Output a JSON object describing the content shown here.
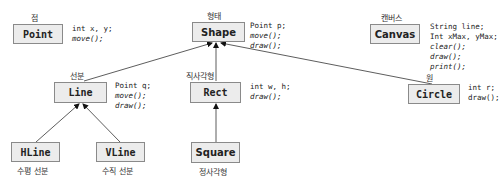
{
  "diagram": {
    "classes": [
      {
        "id": "point",
        "name": "Point",
        "label": "점",
        "fields": [
          "int x, y;"
        ],
        "methods": [
          "move();"
        ]
      },
      {
        "id": "shape",
        "name": "Shape",
        "label": "형태",
        "fields": [
          "Point p;"
        ],
        "methods": [
          "move();",
          "draw();"
        ]
      },
      {
        "id": "canvas",
        "name": "Canvas",
        "label": "캔버스",
        "fields": [
          "String line;",
          "Int xMax, yMax;"
        ],
        "methods": [
          "clear();",
          "draw();",
          "print();"
        ]
      },
      {
        "id": "line",
        "name": "Line",
        "label": "선분",
        "fields": [
          "Point q;"
        ],
        "methods": [
          "move();",
          "draw();"
        ]
      },
      {
        "id": "rect",
        "name": "Rect",
        "label": "직사각형",
        "fields": [
          "int w, h;"
        ],
        "methods": [
          "draw();"
        ]
      },
      {
        "id": "circle",
        "name": "Circle",
        "label": "원",
        "fields": [
          "int r;",
          "draw();"
        ],
        "methods": []
      },
      {
        "id": "hline",
        "name": "HLine",
        "label": "수평 선분",
        "fields": [],
        "methods": []
      },
      {
        "id": "vline",
        "name": "VLine",
        "label": "수직 선분",
        "fields": [],
        "methods": []
      },
      {
        "id": "square",
        "name": "Square",
        "label": "정사각형",
        "fields": [],
        "methods": []
      }
    ],
    "edges": [
      {
        "from": "line",
        "to": "shape",
        "type": "inheritance"
      },
      {
        "from": "rect",
        "to": "shape",
        "type": "inheritance"
      },
      {
        "from": "circle",
        "to": "shape",
        "type": "inheritance"
      },
      {
        "from": "hline",
        "to": "line",
        "type": "inheritance"
      },
      {
        "from": "vline",
        "to": "line",
        "type": "inheritance"
      },
      {
        "from": "square",
        "to": "rect",
        "type": "inheritance"
      }
    ]
  }
}
